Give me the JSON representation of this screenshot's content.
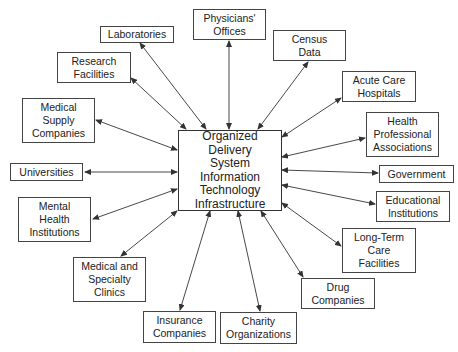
{
  "diagram": {
    "center": {
      "label": "Organized Delivery\nSystem\nInformation\nTechnology\nInfrastructure"
    },
    "nodes": [
      {
        "id": "physicians",
        "label": "Physicians'\nOffices"
      },
      {
        "id": "laboratories",
        "label": "Laboratories"
      },
      {
        "id": "research",
        "label": "Research\nFacilities"
      },
      {
        "id": "census",
        "label": "Census\nData"
      },
      {
        "id": "acute",
        "label": "Acute Care\nHospitals"
      },
      {
        "id": "health-prof",
        "label": "Health\nProfessional\nAssociations"
      },
      {
        "id": "government",
        "label": "Government"
      },
      {
        "id": "universities",
        "label": "Universities"
      },
      {
        "id": "medsupply",
        "label": "Medical\nSupply\nCompanies"
      },
      {
        "id": "mental",
        "label": "Mental\nHealth\nInstitutions"
      },
      {
        "id": "clinics",
        "label": "Medical and\nSpecialty\nClinics"
      },
      {
        "id": "educational",
        "label": "Educational\nInstitutions"
      },
      {
        "id": "longterm",
        "label": "Long-Term\nCare\nFacilities"
      },
      {
        "id": "drug",
        "label": "Drug\nCompanies"
      },
      {
        "id": "insurance",
        "label": "Insurance\nCompanies"
      },
      {
        "id": "charity",
        "label": "Charity\nOrganizations"
      }
    ],
    "edge_type": "bidirectional-arrow",
    "line_color": "#333333"
  }
}
